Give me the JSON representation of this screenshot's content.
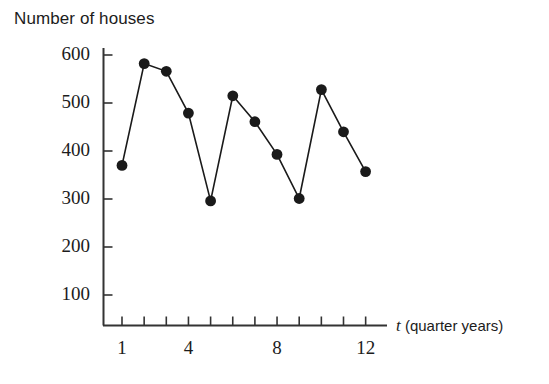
{
  "chart_data": {
    "type": "line",
    "title": "Number of houses",
    "xlabel": "t (quarter years)",
    "xlabel_variable": "t",
    "xlabel_units": "(quarter years)",
    "ylabel": "",
    "x": [
      1,
      2,
      3,
      4,
      5,
      6,
      7,
      8,
      9,
      10,
      11,
      12
    ],
    "values": [
      370,
      582,
      566,
      479,
      296,
      515,
      461,
      393,
      301,
      528,
      440,
      357
    ],
    "xlim": [
      0.2,
      12.8
    ],
    "ylim": [
      0,
      650
    ],
    "xticks": [
      1,
      2,
      3,
      4,
      5,
      6,
      7,
      8,
      9,
      10,
      11,
      12
    ],
    "xtick_labels": [
      "1",
      "4",
      "8",
      "12"
    ],
    "xtick_labelled_values": [
      1,
      4,
      8,
      12
    ],
    "yticks": [
      100,
      200,
      300,
      400,
      500,
      600
    ],
    "ytick_labels": [
      "100",
      "200",
      "300",
      "400",
      "500",
      "600"
    ],
    "grid": false,
    "legend": false,
    "marker": "filled-circle",
    "marker_color": "#1a1a1a",
    "line_color": "#1a1a1a",
    "axis_color": "#333333"
  },
  "axes": {
    "y_labels": [
      {
        "text": "600",
        "value": 600
      },
      {
        "text": "500",
        "value": 500
      },
      {
        "text": "400",
        "value": 400
      },
      {
        "text": "300",
        "value": 300
      },
      {
        "text": "200",
        "value": 200
      },
      {
        "text": "100",
        "value": 100
      }
    ],
    "x_labels": [
      {
        "text": "1",
        "value": 1
      },
      {
        "text": "4",
        "value": 4
      },
      {
        "text": "8",
        "value": 8
      },
      {
        "text": "12",
        "value": 12
      }
    ]
  }
}
